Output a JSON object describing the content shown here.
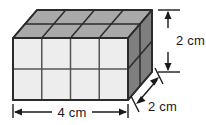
{
  "figure": {
    "name": "rectangular-prism-unit-cubes",
    "background_color": "#ffffff"
  },
  "solid": {
    "shape": "rectangular prism",
    "unit_cubes_along_width": 4,
    "unit_cubes_along_height": 2,
    "unit_cubes_along_depth": 2,
    "total_unit_cubes": 16,
    "colors": {
      "front_face": "#ededed",
      "top_face": "#a9a9a9",
      "right_face": "#7f7f7f",
      "edge_stroke": "#2b2b2b",
      "grid_stroke": "#555555"
    }
  },
  "dimensions": [
    {
      "id": "width",
      "label": "4 cm",
      "value": 4,
      "unit": "cm",
      "axis": "horizontal",
      "position": "bottom"
    },
    {
      "id": "height",
      "label": "2 cm",
      "value": 2,
      "unit": "cm",
      "axis": "vertical",
      "position": "right"
    },
    {
      "id": "depth",
      "label": "2 cm",
      "value": 2,
      "unit": "cm",
      "axis": "diagonal",
      "position": "bottom-right"
    }
  ],
  "labels": {
    "width": "4 cm",
    "height": "2 cm",
    "depth": "2 cm"
  }
}
